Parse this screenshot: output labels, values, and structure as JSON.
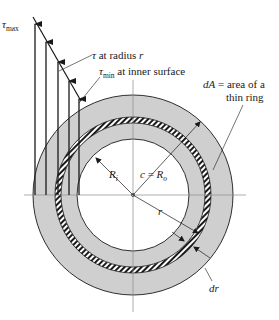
{
  "figure": {
    "colors": {
      "background": "#ffffff",
      "ring_fill": "#cfcfcf",
      "line": "#1a1a1a",
      "center_line": "#8a8a8a"
    },
    "geometry": {
      "center": [
        133,
        195
      ],
      "outer_radius": 100,
      "inner_radius": 56,
      "thin_ring_inner_radius": 72,
      "thin_ring_outer_radius": 78
    },
    "labels": {
      "tau_max": {
        "symbol": "τ",
        "subscript": "max"
      },
      "tau_at_r": {
        "symbol": "τ",
        "text": " at radius ",
        "var": "r"
      },
      "tau_min": {
        "symbol": "τ",
        "subscript": "min",
        "text": " at inner surface"
      },
      "dA_line1": {
        "var": "dA",
        "text": " = area of a"
      },
      "dA_line2": "thin ring",
      "Ri": {
        "var": "R",
        "subscript": "i"
      },
      "c_eq": {
        "var": "c",
        "eq": " = ",
        "var2": "R",
        "subscript": "o"
      },
      "r": "r",
      "dr": "dr"
    },
    "stress_arrows": [
      {
        "x": 35,
        "tip_y": 22
      },
      {
        "x": 46,
        "tip_y": 41
      },
      {
        "x": 58,
        "tip_y": 61
      },
      {
        "x": 69,
        "tip_y": 80
      },
      {
        "x": 79,
        "tip_y": 98
      }
    ]
  }
}
